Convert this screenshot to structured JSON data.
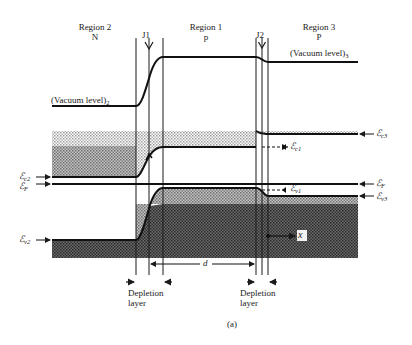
{
  "regions": [
    {
      "name": "Region 2",
      "type": "N"
    },
    {
      "name": "Region 1",
      "type": "p"
    },
    {
      "name": "Region 3",
      "type": "P"
    }
  ],
  "junctions": [
    "J1",
    "J2"
  ],
  "vacuum_levels": {
    "left": {
      "text": "(Vacuum level)",
      "sub": "2"
    },
    "right": {
      "text": "(Vacuum level)",
      "sub": "3"
    }
  },
  "energy_labels": {
    "ec2": {
      "sym": "ℰ",
      "sub": "c2"
    },
    "ef_left": {
      "sym": "ℰ",
      "sub": "F"
    },
    "ev2": {
      "sym": "ℰ",
      "sub": "v2"
    },
    "ec1": {
      "sym": "ℰ",
      "sub": "c1"
    },
    "ev1": {
      "sym": "ℰ",
      "sub": "v1"
    },
    "ec3": {
      "sym": "ℰ",
      "sub": "c3"
    },
    "ef_right": {
      "sym": "ℰ",
      "sub": "F"
    },
    "ev3": {
      "sym": "ℰ",
      "sub": "v3"
    }
  },
  "axis": {
    "x_label": "x"
  },
  "dimension": {
    "d_label": "d"
  },
  "depletion": {
    "left": [
      "Depletion",
      "layer"
    ],
    "right": [
      "Depletion",
      "layer"
    ]
  },
  "caption": "(a)"
}
